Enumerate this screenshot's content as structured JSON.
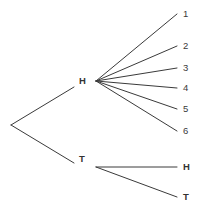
{
  "diagram": {
    "type": "probability-tree",
    "background_color": "#ffffff",
    "line_color": "#3a3a3a",
    "text_color": "#333333",
    "root": {
      "name": "root-node",
      "x": 11,
      "y": 125,
      "label": ""
    },
    "level1": [
      {
        "name": "node-heads",
        "label": "H",
        "label_x": 79,
        "label_y": 76,
        "edge_end_x": 74,
        "edge_end_y": 87,
        "fan_x": 96,
        "fan_y": 81
      },
      {
        "name": "node-tails",
        "label": "T",
        "label_x": 79,
        "label_y": 154,
        "edge_end_x": 74,
        "edge_end_y": 163,
        "fan_x": 96,
        "fan_y": 167
      }
    ],
    "heads_outcomes": [
      {
        "label": "1",
        "end_x": 177,
        "end_y": 14,
        "label_x": 183,
        "label_y": 9
      },
      {
        "label": "2",
        "end_x": 177,
        "end_y": 46,
        "label_x": 183,
        "label_y": 41
      },
      {
        "label": "3",
        "end_x": 177,
        "end_y": 68,
        "label_x": 183,
        "label_y": 63
      },
      {
        "label": "4",
        "end_x": 177,
        "end_y": 88,
        "label_x": 183,
        "label_y": 83
      },
      {
        "label": "5",
        "end_x": 177,
        "end_y": 109,
        "label_x": 183,
        "label_y": 104
      },
      {
        "label": "6",
        "end_x": 177,
        "end_y": 131,
        "label_x": 183,
        "label_y": 126
      }
    ],
    "tails_outcomes": [
      {
        "label": "H",
        "end_x": 177,
        "end_y": 167,
        "label_x": 183,
        "label_y": 162
      },
      {
        "label": "T",
        "end_x": 177,
        "end_y": 197,
        "label_x": 183,
        "label_y": 192
      }
    ]
  }
}
